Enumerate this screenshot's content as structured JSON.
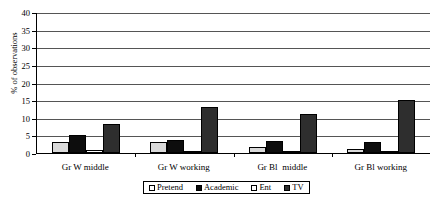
{
  "chart_data": {
    "type": "bar",
    "title": "",
    "xlabel": "",
    "ylabel": "% of observations",
    "ylim": [
      0,
      40
    ],
    "yticks": [
      0,
      5,
      10,
      15,
      20,
      25,
      30,
      35,
      40
    ],
    "grid": true,
    "legend_position": "bottom",
    "categories": [
      "Gr W middle",
      "Gr W working",
      "Gr Bl  middle",
      "Gr Bl working"
    ],
    "series": [
      {
        "name": "Pretend",
        "color": "#d9d9d9",
        "values": [
          3.1,
          3.0,
          1.7,
          1.1
        ]
      },
      {
        "name": "Academic",
        "color": "#0d0d0d",
        "values": [
          5.1,
          3.7,
          3.5,
          3.2
        ]
      },
      {
        "name": "Ent",
        "color": "#fdfdfd",
        "values": [
          0.9,
          0.5,
          0.4,
          0.3
        ]
      },
      {
        "name": "TV",
        "color": "#2e2e2e",
        "values": [
          8.2,
          13.0,
          11.0,
          15.0
        ]
      }
    ]
  },
  "axis": {
    "y_tick_labels": [
      "0",
      "5",
      "10",
      "15",
      "20",
      "25",
      "30",
      "35",
      "40"
    ],
    "y_title": "% of observations"
  },
  "legend": {
    "items": [
      {
        "label": "Pretend"
      },
      {
        "label": "Academic"
      },
      {
        "label": "Ent"
      },
      {
        "label": "TV"
      }
    ]
  }
}
